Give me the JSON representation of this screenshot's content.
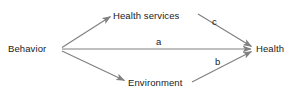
{
  "diagram": {
    "type": "path-diagram",
    "title": "",
    "background_color": "#ffffff",
    "arrow_color": "#808080",
    "text_color": "#1a1a1a",
    "nodes": [
      {
        "id": "behavior",
        "label": "Behavior"
      },
      {
        "id": "health_services",
        "label": "Health services"
      },
      {
        "id": "environment",
        "label": "Environment"
      },
      {
        "id": "health",
        "label": "Health"
      }
    ],
    "edges": [
      {
        "id": "behavior_to_health_services",
        "from": "Behavior",
        "to": "Health services",
        "label": ""
      },
      {
        "id": "behavior_to_health",
        "from": "Behavior",
        "to": "Health",
        "label": "a"
      },
      {
        "id": "behavior_to_environment",
        "from": "Behavior",
        "to": "Environment",
        "label": ""
      },
      {
        "id": "health_services_to_health",
        "from": "Health services",
        "to": "Health",
        "label": "c"
      },
      {
        "id": "environment_to_health",
        "from": "Environment",
        "to": "Health",
        "label": "b"
      }
    ]
  }
}
